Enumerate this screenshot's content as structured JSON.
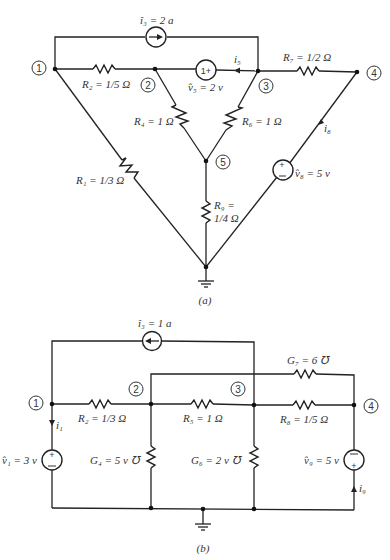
{
  "circuit_a": {
    "caption": "(a)",
    "nodes": [
      "1",
      "2",
      "3",
      "4",
      "5"
    ],
    "i3_label": "î₃ = 2 a",
    "R2_label": "R₂ = 1/5 Ω",
    "v5_label": "v̂₅ = 2 v",
    "v5_sign": "1+",
    "i5_label": "i₅",
    "R7_label": "R₇ = 1/2 Ω",
    "R4_label": "R₄ = 1 Ω",
    "R6_label": "R₆ = 1 Ω",
    "i8_label": "i₈",
    "R1_label": "R₁ = 1/3 Ω",
    "v8_label": "v̂₈ = 5 v",
    "R9_label_1": "R₉ =",
    "R9_label_2": "1/4 Ω"
  },
  "circuit_b": {
    "caption": "(b)",
    "nodes": [
      "1",
      "2",
      "3",
      "4"
    ],
    "i3_label": "î₃ = 1 a",
    "G7_label": "G₇ = 6 ℧",
    "R2_label": "R₂ = 1/3 Ω",
    "R5_label": "R₅ = 1 Ω",
    "R8_label": "R₈ = 1/5 Ω",
    "i1_label": "i₁",
    "v1_label": "v̂₁ = 3 v",
    "G4_label": "G₄ = 5 v ℧",
    "G6_label": "G₆ = 2 v ℧",
    "v9_label": "v̂₉ = 5 v",
    "i9_label": "i₉"
  }
}
